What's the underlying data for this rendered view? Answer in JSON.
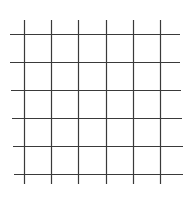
{
  "diagram": {
    "type": "grid",
    "line_color": "#3a3a3a",
    "line_width": 1.2,
    "background": "#ffffff",
    "vertical_lines": [
      {
        "x": 24,
        "y1": 20,
        "y2": 184
      },
      {
        "x": 51,
        "y1": 20,
        "y2": 184
      },
      {
        "x": 78,
        "y1": 20,
        "y2": 184
      },
      {
        "x": 106,
        "y1": 20,
        "y2": 184
      },
      {
        "x": 133,
        "y1": 20,
        "y2": 184
      },
      {
        "x": 160,
        "y1": 20,
        "y2": 184
      }
    ],
    "horizontal_lines": [
      {
        "y": 34,
        "x1": 10,
        "x2": 180
      },
      {
        "y": 62,
        "x1": 10,
        "x2": 180
      },
      {
        "y": 90,
        "x1": 11,
        "x2": 181
      },
      {
        "y": 118,
        "x1": 12,
        "x2": 182
      },
      {
        "y": 146,
        "x1": 13,
        "x2": 183
      },
      {
        "y": 174,
        "x1": 14,
        "x2": 183
      }
    ]
  }
}
